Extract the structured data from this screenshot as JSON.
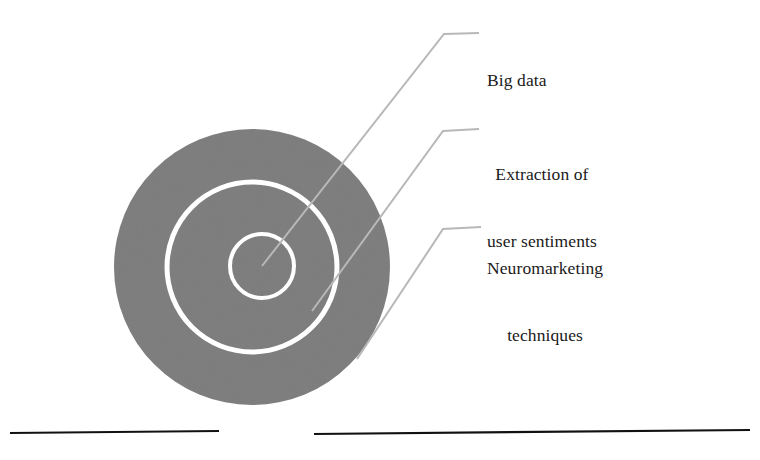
{
  "figure": {
    "type": "concentric-circles-diagram",
    "background_color": "#ffffff"
  },
  "colors": {
    "disc_fill": "#808080",
    "ring_stroke": "#ffffff",
    "leader_line": "#b8b8b8",
    "baseline": "#111111",
    "text": "#1a1a1a"
  },
  "disc": {
    "name": "outer-disc",
    "center_x": 252,
    "center_y": 267,
    "radius": 138
  },
  "rings": [
    {
      "name": "middle-ring",
      "center_x": 252,
      "center_y": 267,
      "radius": 85,
      "stroke_width": 5
    },
    {
      "name": "inner-ring",
      "center_x": 262,
      "center_y": 266,
      "radius": 32,
      "stroke_width": 4
    }
  ],
  "callouts": [
    {
      "id": "big-data",
      "lines": [
        "Big data"
      ],
      "text": "Big data",
      "align": "left",
      "leader": {
        "start_x": 262,
        "start_y": 266,
        "elbow_x": 444,
        "elbow_y": 34,
        "end_x": 479,
        "end_y": 33
      }
    },
    {
      "id": "extraction-of-user-sentiments",
      "lines": [
        "Extraction of",
        "user sentiments"
      ],
      "text": "Extraction of user sentiments",
      "align": "center",
      "leader": {
        "start_x": 312,
        "start_y": 311,
        "elbow_x": 443,
        "elbow_y": 131,
        "end_x": 479,
        "end_y": 129
      }
    },
    {
      "id": "neuromarketing-techniques",
      "lines": [
        "Neuromarketing",
        "techniques"
      ],
      "text": "Neuromarketing techniques",
      "align": "center",
      "leader": {
        "start_x": 357,
        "start_y": 359,
        "elbow_x": 443,
        "elbow_y": 229,
        "end_x": 481,
        "end_y": 227
      }
    }
  ],
  "baseline": {
    "name": "ground-line",
    "segments": [
      {
        "x1": 10,
        "y1": 433,
        "x2": 219,
        "y2": 431
      },
      {
        "x1": 314,
        "y1": 434,
        "x2": 750,
        "y2": 430
      }
    ],
    "stroke_width": 2.2
  }
}
